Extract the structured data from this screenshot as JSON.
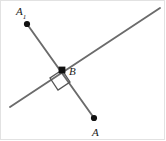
{
  "figure": {
    "canvas": {
      "width": 166,
      "height": 141
    },
    "background_color": "#ffffff",
    "border_color": "#e2e2e2",
    "line_color": "#6b6b6b",
    "point_color": "#111111",
    "label_color": "#1a1a1a",
    "labels": {
      "a1_base": "A",
      "a1_subscript": "1",
      "b": "B",
      "a": "A"
    },
    "points": [
      {
        "name": "A1",
        "x": 27,
        "y": 24
      },
      {
        "name": "B",
        "x": 62,
        "y": 70
      },
      {
        "name": "A",
        "x": 94,
        "y": 118
      }
    ],
    "lines": [
      {
        "name": "diagonal-line",
        "x1": 10,
        "y1": 107,
        "x2": 160,
        "y2": 8
      },
      {
        "name": "segment-a1-a",
        "x1": 27,
        "y1": 24,
        "x2": 94,
        "y2": 118
      }
    ],
    "right_angle_marker": {
      "name": "right-angle-square",
      "points": "62,70 50,78 58,90 70,82"
    }
  }
}
